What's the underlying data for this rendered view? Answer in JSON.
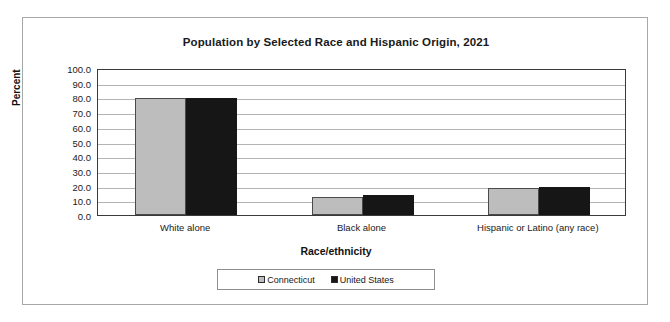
{
  "chart_data": {
    "type": "bar",
    "title": "Population by Selected Race and Hispanic Origin, 2021",
    "xlabel": "Race/ethnicity",
    "ylabel": "Percent",
    "ylim": [
      0,
      100
    ],
    "ytick_step": 10,
    "ytick_labels": [
      "100.0",
      "90.0",
      "80.0",
      "70.0",
      "60.0",
      "50.0",
      "40.0",
      "30.0",
      "20.0",
      "10.0",
      "0.0"
    ],
    "categories": [
      "White alone",
      "Black alone",
      "Hispanic or Latino (any race)"
    ],
    "series": [
      {
        "name": "Connecticut",
        "color": "#bdbdbd",
        "values": [
          79.6,
          12.3,
          18.3
        ]
      },
      {
        "name": "United States",
        "color": "#161616",
        "values": [
          79.7,
          13.6,
          19.1
        ]
      }
    ],
    "grid": true,
    "legend_position": "bottom"
  }
}
